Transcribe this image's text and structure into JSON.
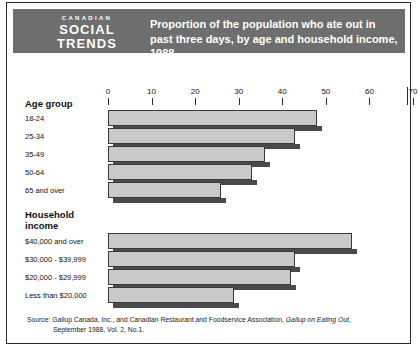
{
  "header": {
    "brand_kicker": "CANADIAN",
    "brand_line1": "SOCIAL",
    "brand_line2": "TRENDS",
    "title": "Proportion of the population who ate out in past three days, by age and household income, 1988",
    "band_color": "#6e6e6e"
  },
  "groups": {
    "age_title": "Age group",
    "income_title_line1": "Household",
    "income_title_line2": "income"
  },
  "source": {
    "line1_a": "Source: Gallup Canada, Inc., and Canadian Restaurant and Foodservice Association, ",
    "line1_italic": "Gallup on Eating Out",
    "line1_b": ",",
    "line2": "September 1988, Vol. 2, No.1."
  },
  "chart_data": {
    "type": "bar",
    "orientation": "horizontal",
    "title": "Proportion of the population who ate out in past three days, by age and household income, 1988",
    "xlabel": "",
    "ylabel": "",
    "xlim": [
      0,
      70
    ],
    "xticks": [
      0,
      10,
      20,
      30,
      40,
      50,
      60,
      70
    ],
    "xtick_labels": [
      "0",
      "10",
      "20",
      "30",
      "40",
      "50",
      "60",
      "70"
    ],
    "grid": false,
    "legend": "none",
    "units": "percent",
    "bar_color": "#c9c9c9",
    "shadow_color": "#4a4a4a",
    "groups": [
      {
        "name": "Age group",
        "categories": [
          "18-24",
          "25-34",
          "35-49",
          "50-64",
          "65 and over"
        ],
        "values": [
          48,
          43,
          36,
          33,
          26
        ]
      },
      {
        "name": "Household income",
        "categories": [
          "$40,000 and over",
          "$30,000 - $39,999",
          "$20,000 - $29,999",
          "Less than $20,000"
        ],
        "values": [
          56,
          43,
          42,
          29
        ]
      }
    ]
  }
}
